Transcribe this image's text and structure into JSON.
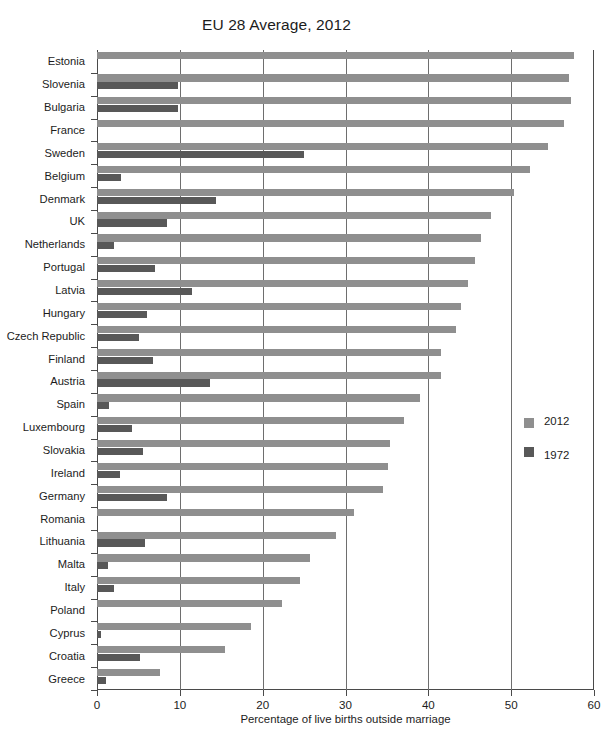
{
  "chart_data": {
    "type": "bar",
    "orientation": "horizontal",
    "title": "EU 28 Average, 2012",
    "xlabel": "Percentage of live births outside marriage",
    "ylabel": "",
    "xlim": [
      0,
      60
    ],
    "xticks": [
      0,
      10,
      20,
      30,
      40,
      50,
      60
    ],
    "xticklabels": [
      "0",
      "10",
      "20",
      "30",
      "40",
      "50",
      "60"
    ],
    "grid": "vertical",
    "legend_position": "right",
    "categories": [
      "Estonia",
      "Slovenia",
      "Bulgaria",
      "France",
      "Sweden",
      "Belgium",
      "Denmark",
      "UK",
      "Netherlands",
      "Portugal",
      "Latvia",
      "Hungary",
      "Czech Republic",
      "Finland",
      "Austria",
      "Spain",
      "Luxembourg",
      "Slovakia",
      "Ireland",
      "Germany",
      "Romania",
      "Lithuania",
      "Malta",
      "Italy",
      "Poland",
      "Cyprus",
      "Croatia",
      "Greece"
    ],
    "series": [
      {
        "name": "2012",
        "color": "#8f8f8f",
        "values": [
          57.6,
          57.0,
          57.2,
          56.4,
          54.5,
          52.3,
          50.4,
          47.6,
          46.4,
          45.6,
          44.8,
          44.0,
          43.4,
          41.5,
          41.5,
          39.0,
          37.1,
          35.4,
          35.1,
          34.5,
          31.0,
          28.8,
          25.7,
          24.5,
          22.3,
          18.6,
          15.4,
          7.6
        ]
      },
      {
        "name": "1972",
        "color": "#585858",
        "values": [
          0.0,
          9.8,
          9.8,
          0.0,
          25.0,
          2.9,
          14.4,
          8.5,
          2.0,
          7.0,
          11.5,
          6.0,
          5.1,
          6.8,
          13.6,
          1.4,
          4.2,
          5.5,
          2.8,
          8.5,
          0.0,
          5.8,
          1.3,
          2.1,
          0.0,
          0.5,
          5.2,
          1.1
        ]
      }
    ]
  },
  "legend": {
    "items": [
      {
        "label": "2012",
        "color": "#8f8f8f"
      },
      {
        "label": "1972",
        "color": "#585858"
      }
    ]
  }
}
